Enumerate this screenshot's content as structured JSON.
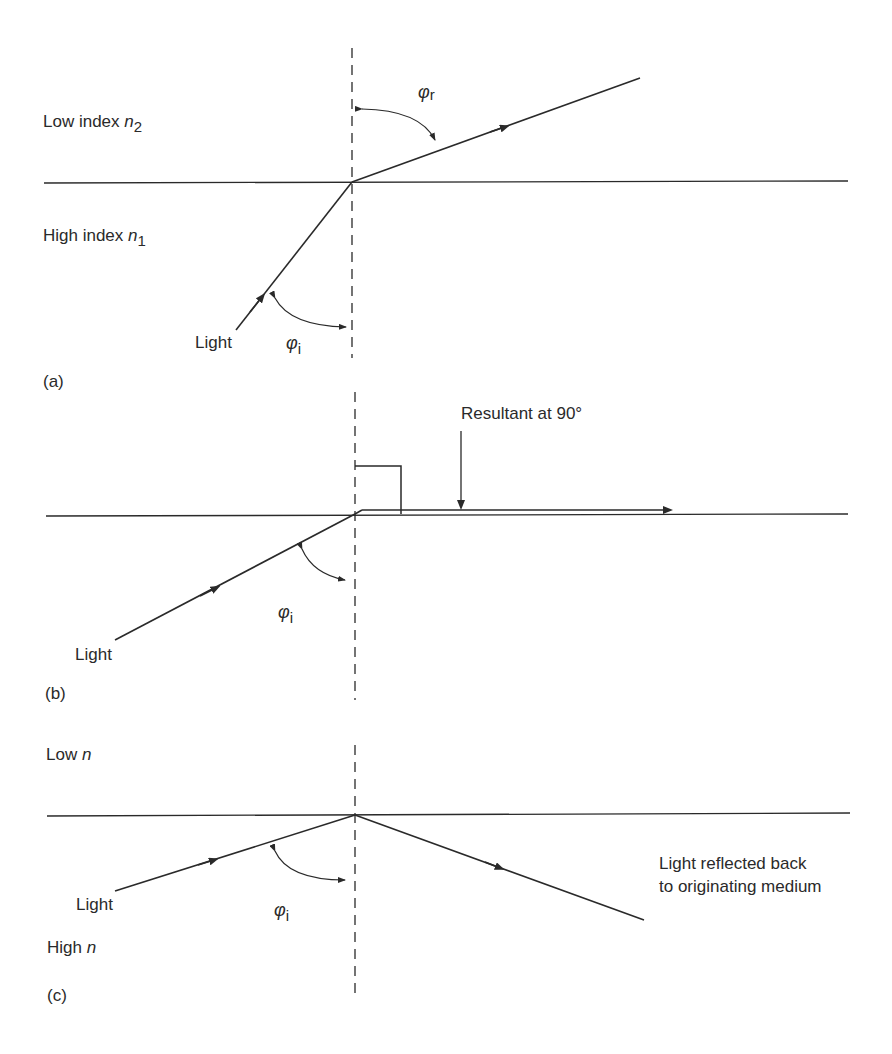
{
  "figure": {
    "panel_a": {
      "tag": "(a)",
      "upper_medium": {
        "text": "Low index ",
        "var": "n",
        "sub": "2"
      },
      "lower_medium": {
        "text": "High index ",
        "var": "n",
        "sub": "1"
      },
      "incident_label": "Light",
      "incident_angle": {
        "symbol": "φ",
        "sub": "i"
      },
      "refracted_angle": {
        "symbol": "φ",
        "sub": "r"
      }
    },
    "panel_b": {
      "tag": "(b)",
      "incident_label": "Light",
      "incident_angle": {
        "symbol": "φ",
        "sub": "i"
      },
      "callout": "Resultant at 90°"
    },
    "panel_c": {
      "tag": "(c)",
      "upper_medium": {
        "text": "Low ",
        "var": "n"
      },
      "lower_medium": {
        "text": "High ",
        "var": "n"
      },
      "incident_label": "Light",
      "incident_angle": {
        "symbol": "φ",
        "sub": "i"
      },
      "reflected_label_line1": "Light reflected back",
      "reflected_label_line2": "to originating medium"
    },
    "colors": {
      "ink": "#2a2a2a",
      "background": "#ffffff"
    }
  }
}
